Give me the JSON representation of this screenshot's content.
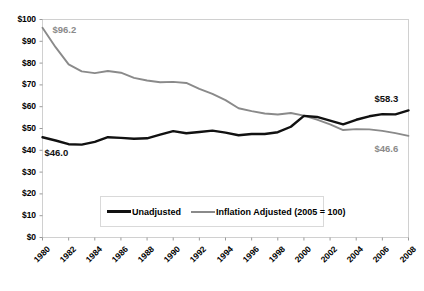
{
  "chart_data": {
    "type": "line",
    "title": "",
    "xlabel": "",
    "ylabel": "",
    "x": [
      1980,
      1981,
      1982,
      1983,
      1984,
      1985,
      1986,
      1987,
      1988,
      1989,
      1990,
      1991,
      1992,
      1993,
      1994,
      1995,
      1996,
      1997,
      1998,
      1999,
      2000,
      2001,
      2002,
      2003,
      2004,
      2005,
      2006,
      2007,
      2008
    ],
    "xlim": [
      1980,
      2008
    ],
    "ylim": [
      0,
      100
    ],
    "ytick_values": [
      0,
      10,
      20,
      30,
      40,
      50,
      60,
      70,
      80,
      90,
      100
    ],
    "ytick_labels": [
      "$0",
      "$10",
      "$20",
      "$30",
      "$40",
      "$50",
      "$60",
      "$70",
      "$80",
      "$90",
      "$100"
    ],
    "xtick_values": [
      1980,
      1982,
      1984,
      1986,
      1988,
      1990,
      1992,
      1994,
      1996,
      1998,
      2000,
      2002,
      2004,
      2006,
      2008
    ],
    "xtick_labels": [
      "1980",
      "1982",
      "1984",
      "1986",
      "1988",
      "1990",
      "1992",
      "1994",
      "1996",
      "1998",
      "2000",
      "2002",
      "2004",
      "2006",
      "2008"
    ],
    "grid": false,
    "legend_position": "bottom-center-inside",
    "series": [
      {
        "name": "Unadjusted",
        "color": "#111111",
        "values": [
          46.0,
          44.5,
          42.8,
          42.6,
          43.9,
          46.0,
          45.7,
          45.3,
          45.5,
          47.2,
          48.8,
          47.8,
          48.4,
          49.0,
          48.1,
          46.9,
          47.5,
          47.5,
          48.3,
          50.8,
          55.8,
          55.3,
          53.6,
          51.9,
          54.0,
          55.6,
          56.6,
          56.5,
          58.3
        ]
      },
      {
        "name": "Inflation Adjusted (2005 = 100)",
        "color": "#8a8a8a",
        "values": [
          96.2,
          87.3,
          79.4,
          76.2,
          75.4,
          76.4,
          75.6,
          73.2,
          72.0,
          71.2,
          71.4,
          70.9,
          68.2,
          65.9,
          63.0,
          59.3,
          58.0,
          56.9,
          56.4,
          57.1,
          55.9,
          54.1,
          51.9,
          49.3,
          49.7,
          49.6,
          48.9,
          47.9,
          46.6
        ]
      }
    ],
    "annotations": [
      {
        "text": "$96.2",
        "series": "Inflation Adjusted (2005 = 100)",
        "at_x": 1980,
        "at_y": 96.2,
        "color": "#8a8a8a"
      },
      {
        "text": "$46.0",
        "series": "Unadjusted",
        "at_x": 1980,
        "at_y": 46.0,
        "color": "#111111"
      },
      {
        "text": "$58.3",
        "series": "Unadjusted",
        "at_x": 2008,
        "at_y": 58.3,
        "color": "#111111"
      },
      {
        "text": "$46.6",
        "series": "Inflation Adjusted (2005 = 100)",
        "at_x": 2008,
        "at_y": 46.6,
        "color": "#8a8a8a"
      }
    ]
  },
  "legend": {
    "items": [
      {
        "label": "Unadjusted",
        "color": "#111111"
      },
      {
        "label": "Inflation Adjusted (2005 = 100)",
        "color": "#8a8a8a"
      }
    ]
  },
  "colors": {
    "unadjusted": "#111111",
    "inflation_adjusted": "#8a8a8a",
    "axis": "#b3b3b3",
    "background": "#ffffff"
  }
}
